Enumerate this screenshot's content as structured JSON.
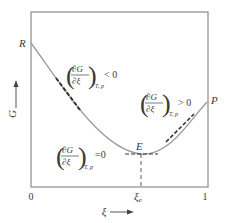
{
  "diagram": {
    "y_axis_label": "G",
    "x_axis_label": "ξ",
    "x_ticks": [
      "0",
      "ξe",
      "1"
    ],
    "points": {
      "R": "R",
      "E": "E",
      "P": "P"
    },
    "annotations": [
      {
        "id": "left",
        "numerator": "∂G",
        "denominator": "∂ξ",
        "subscript": "T, p",
        "relation": "< 0"
      },
      {
        "id": "min",
        "numerator": "∂G",
        "denominator": "∂ξ",
        "subscript": "T, p",
        "relation": "=0"
      },
      {
        "id": "right",
        "numerator": "∂G",
        "denominator": "∂ξ",
        "subscript": "T, p",
        "relation": "> 0"
      }
    ],
    "colors": {
      "frame": "#8a8a8a",
      "curve": "#9a9a9a",
      "tangent": "#333333",
      "text": "#3a3a3a"
    }
  }
}
